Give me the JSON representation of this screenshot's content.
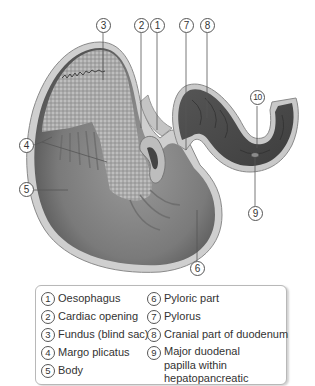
{
  "diagram": {
    "colors": {
      "outline": "#9a9a9a",
      "wall": "#c9c9c9",
      "mucosa_dark": "#5a5a5a",
      "mucosa_mid": "#7d7d7d",
      "fundus_texture": "#a8a8a8",
      "duodenum_dark": "#4a4a4a"
    },
    "callouts": [
      {
        "num": "1",
        "x": 150,
        "y": 18
      },
      {
        "num": "2",
        "x": 134,
        "y": 18
      },
      {
        "num": "3",
        "x": 96,
        "y": 18
      },
      {
        "num": "4",
        "x": 19,
        "y": 138
      },
      {
        "num": "5",
        "x": 19,
        "y": 182
      },
      {
        "num": "6",
        "x": 190,
        "y": 261
      },
      {
        "num": "7",
        "x": 179,
        "y": 18
      },
      {
        "num": "8",
        "x": 200,
        "y": 18
      },
      {
        "num": "9",
        "x": 248,
        "y": 206
      },
      {
        "num": "10",
        "x": 250,
        "y": 90
      }
    ]
  },
  "legend": {
    "left_column": [
      {
        "num": "1",
        "label": "Oesophagus"
      },
      {
        "num": "2",
        "label": "Cardiac opening"
      },
      {
        "num": "3",
        "label": "Fundus (blind sac)"
      },
      {
        "num": "4",
        "label": "Margo plicatus"
      },
      {
        "num": "5",
        "label": "Body"
      }
    ],
    "right_column": [
      {
        "num": "6",
        "label": "Pyloric part"
      },
      {
        "num": "7",
        "label": "Pylorus"
      },
      {
        "num": "8",
        "label": "Cranial part of duodenum"
      },
      {
        "num": "9",
        "label": "Major duodenal papilla within hepatopancreatic"
      }
    ]
  }
}
